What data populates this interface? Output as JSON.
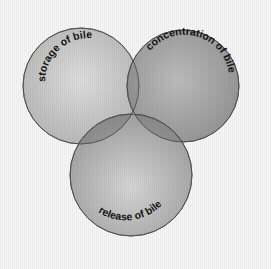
{
  "diagram": {
    "type": "venn",
    "background": "#f6f6f6",
    "circles": [
      {
        "id": "storage",
        "label": "storage of bile",
        "cx": 81,
        "cy": 86,
        "r": 58,
        "fill_center": "#dcdcdc",
        "fill_edge": "#b4b4b4"
      },
      {
        "id": "concentration",
        "label": "concentration of bile",
        "cx": 183,
        "cy": 86,
        "r": 56,
        "fill_center": "#b2b2b2",
        "fill_edge": "#8e8e8e"
      },
      {
        "id": "release",
        "label": "release of bile",
        "cx": 131,
        "cy": 175,
        "r": 61,
        "fill_center": "#c8c8c8",
        "fill_edge": "#909090"
      }
    ],
    "stroke_color": "#4a4a4a"
  }
}
